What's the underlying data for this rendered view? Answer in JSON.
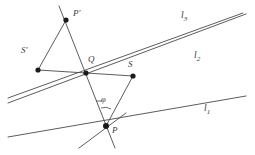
{
  "figure": {
    "kind": "geometry-diagram",
    "stroke_color": "#4a4a4a",
    "point_color": "#1a1a1a",
    "background": "#ffffff",
    "width": 255,
    "height": 155
  },
  "points": [
    {
      "id": "P-prime",
      "label": "P′",
      "x": 66,
      "y": 20,
      "label_x": 73,
      "label_y": 13
    },
    {
      "id": "S-prime",
      "label": "S′",
      "x": 38,
      "y": 70,
      "label_x": 23,
      "label_y": 50
    },
    {
      "id": "Q",
      "label": "Q",
      "x": 86,
      "y": 73,
      "label_x": 88,
      "label_y": 59
    },
    {
      "id": "S",
      "label": "S",
      "x": 133,
      "y": 76,
      "label_x": 130,
      "label_y": 64
    },
    {
      "id": "P",
      "label": "P",
      "x": 106,
      "y": 126,
      "label_x": 112,
      "label_y": 128
    }
  ],
  "lines": [
    {
      "id": "l1",
      "label": "l",
      "subscript": "1",
      "label_x": 206,
      "label_y": 110
    },
    {
      "id": "l2",
      "label": "l",
      "subscript": "2",
      "label_x": 196,
      "label_y": 57
    },
    {
      "id": "l3",
      "label": "l",
      "subscript": "3",
      "label_x": 183,
      "label_y": 17
    }
  ],
  "angles": [
    {
      "id": "phi",
      "label": "φ",
      "label_x": 98,
      "label_y": 101
    }
  ],
  "segments": [
    {
      "id": "l1-line",
      "x1": 8,
      "y1": 137,
      "x2": 246,
      "y2": 96
    },
    {
      "id": "l2-line",
      "x1": 8,
      "y1": 103,
      "x2": 246,
      "y2": 14
    },
    {
      "id": "l3-line",
      "x1": 8,
      "y1": 98,
      "x2": 243,
      "y2": 13
    },
    {
      "id": "seg-Pprime-P",
      "x1": 59,
      "y1": 6,
      "x2": 115,
      "y2": 148
    },
    {
      "id": "seg-Pprime-Sprime",
      "x1": 66,
      "y1": 20,
      "x2": 38,
      "y2": 70
    },
    {
      "id": "seg-Sprime-S",
      "x1": 38,
      "y1": 70,
      "x2": 133,
      "y2": 76
    },
    {
      "id": "seg-S-P",
      "x1": 133,
      "y1": 76,
      "x2": 106,
      "y2": 126
    },
    {
      "id": "seg-through-P-down-left",
      "x1": 79,
      "y1": 148,
      "x2": 126,
      "y2": 113
    }
  ]
}
